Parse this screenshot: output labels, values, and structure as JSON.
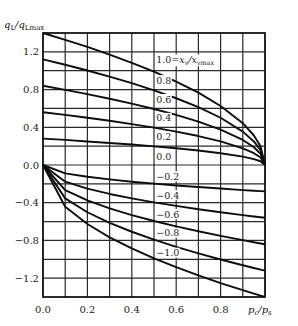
{
  "chart_data": {
    "type": "line",
    "title": "",
    "xlabel": "p_c/p_s",
    "ylabel": "q_L/q_Lmax",
    "xlim": [
      0.0,
      1.0
    ],
    "ylim": [
      -1.4,
      1.4
    ],
    "grid": true,
    "x_ticks": [
      0.0,
      0.2,
      0.4,
      0.6,
      0.8
    ],
    "x_tick_labels": [
      "0.0",
      "0.2",
      "0.4",
      "0.6",
      "0.8"
    ],
    "y_ticks": [
      1.2,
      0.8,
      0.4,
      0.0,
      -0.4,
      -0.8,
      -1.2
    ],
    "y_tick_labels": [
      "1.2",
      "0.8",
      "0.4",
      "0.0",
      "−0.4",
      "−0.8",
      "−1.2"
    ],
    "grid_x_step": 0.1,
    "grid_y_step": 0.2,
    "legend_title": "x_v/x_vmax",
    "x": [
      0.0,
      0.1,
      0.2,
      0.3,
      0.4,
      0.5,
      0.6,
      0.7,
      0.8,
      0.9,
      0.95,
      0.98,
      1.0
    ],
    "series": [
      {
        "name": "1.0",
        "group": "positive",
        "values": [
          1.4,
          1.328,
          1.252,
          1.171,
          1.084,
          0.99,
          0.885,
          0.767,
          0.626,
          0.443,
          0.313,
          0.198,
          0.0
        ]
      },
      {
        "name": "0.8",
        "group": "positive",
        "values": [
          1.12,
          1.063,
          1.002,
          0.937,
          0.868,
          0.792,
          0.708,
          0.613,
          0.501,
          0.354,
          0.25,
          0.158,
          0.0
        ]
      },
      {
        "name": "0.6",
        "group": "positive",
        "values": [
          0.84,
          0.797,
          0.751,
          0.703,
          0.651,
          0.594,
          0.531,
          0.46,
          0.376,
          0.266,
          0.188,
          0.119,
          0.0
        ]
      },
      {
        "name": "0.4",
        "group": "positive",
        "values": [
          0.56,
          0.531,
          0.501,
          0.469,
          0.434,
          0.396,
          0.354,
          0.307,
          0.25,
          0.177,
          0.125,
          0.079,
          0.0
        ]
      },
      {
        "name": "0.2",
        "group": "positive",
        "values": [
          0.28,
          0.266,
          0.25,
          0.234,
          0.217,
          0.198,
          0.177,
          0.153,
          0.125,
          0.089,
          0.063,
          0.04,
          0.0
        ]
      },
      {
        "name": "0.0",
        "group": "zero",
        "values": [
          0.0,
          0.0,
          0.0,
          0.0,
          0.0,
          0.0,
          0.0,
          0.0,
          0.0,
          0.0,
          0.0,
          0.0,
          0.0
        ]
      },
      {
        "name": "-0.2",
        "group": "negative",
        "values": [
          0.0,
          -0.089,
          -0.125,
          -0.153,
          -0.177,
          -0.198,
          -0.217,
          -0.234,
          -0.25,
          -0.266,
          -0.273,
          -0.277,
          -0.28
        ]
      },
      {
        "name": "-0.4",
        "group": "negative",
        "values": [
          0.0,
          -0.177,
          -0.25,
          -0.307,
          -0.354,
          -0.396,
          -0.434,
          -0.469,
          -0.501,
          -0.531,
          -0.546,
          -0.554,
          -0.56
        ]
      },
      {
        "name": "-0.6",
        "group": "negative",
        "values": [
          0.0,
          -0.266,
          -0.376,
          -0.46,
          -0.531,
          -0.594,
          -0.651,
          -0.703,
          -0.751,
          -0.797,
          -0.819,
          -0.832,
          -0.84
        ]
      },
      {
        "name": "-0.8",
        "group": "negative",
        "values": [
          0.0,
          -0.354,
          -0.501,
          -0.613,
          -0.708,
          -0.792,
          -0.868,
          -0.937,
          -1.002,
          -1.063,
          -1.092,
          -1.109,
          -1.12
        ]
      },
      {
        "name": "-1.0",
        "group": "negative",
        "values": [
          0.0,
          -0.443,
          -0.626,
          -0.767,
          -0.885,
          -0.99,
          -1.084,
          -1.171,
          -1.252,
          -1.328,
          -1.365,
          -1.386,
          -1.4
        ]
      }
    ],
    "curve_labels": [
      {
        "text": "1.0=x_v/x_vmax",
        "y": 1.12
      },
      {
        "text": "0.8",
        "y": 0.9
      },
      {
        "text": "0.6",
        "y": 0.7
      },
      {
        "text": "0.4",
        "y": 0.5
      },
      {
        "text": "0.2",
        "y": 0.3
      },
      {
        "text": "0.0",
        "y": 0.09
      },
      {
        "text": "−0.2",
        "y": -0.12
      },
      {
        "text": "−0.4",
        "y": -0.32
      },
      {
        "text": "−0.6",
        "y": -0.52
      },
      {
        "text": "−0.8",
        "y": -0.72
      },
      {
        "text": "−1.0",
        "y": -0.93
      }
    ],
    "curve_label_x": 0.51
  }
}
